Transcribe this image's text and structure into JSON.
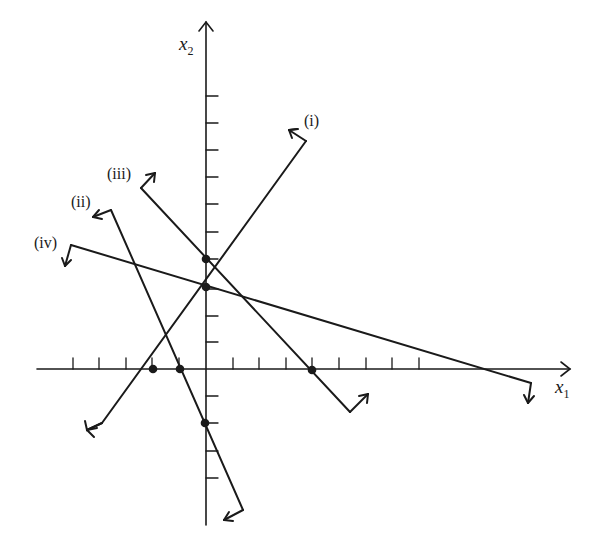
{
  "figure": {
    "axes": {
      "x_label": "x",
      "x_label_sub": "1",
      "y_label": "x",
      "y_label_sub": "2",
      "origin": [
        206,
        369
      ],
      "tick_spacing_px": 26.6,
      "x_ticks_left": 5,
      "x_ticks_right": 8,
      "y_ticks_up": 10,
      "y_ticks_down": 4
    },
    "lines": [
      {
        "id": "i",
        "label": "(i)",
        "x_intercept": -2,
        "y_intercept": 3,
        "half_plane": "up-left"
      },
      {
        "id": "ii",
        "label": "(ii)",
        "x_intercept": -1,
        "y_intercept": -2,
        "half_plane": "left"
      },
      {
        "id": "iii",
        "label": "(iii)",
        "x_intercept": 4,
        "y_intercept": 4,
        "half_plane": "up-right"
      },
      {
        "id": "iv",
        "label": "(iv)",
        "x_intercept": 11,
        "y_intercept": 3,
        "half_plane": "down"
      }
    ],
    "points": [
      {
        "x": -2,
        "y": 0
      },
      {
        "x": -1,
        "y": 0
      },
      {
        "x": 4,
        "y": 0
      },
      {
        "x": 0,
        "y": 4
      },
      {
        "x": 0,
        "y": 3
      },
      {
        "x": 0,
        "y": -2
      }
    ],
    "colors": {
      "ink": "#1a1a1a",
      "background": "#ffffff"
    }
  }
}
